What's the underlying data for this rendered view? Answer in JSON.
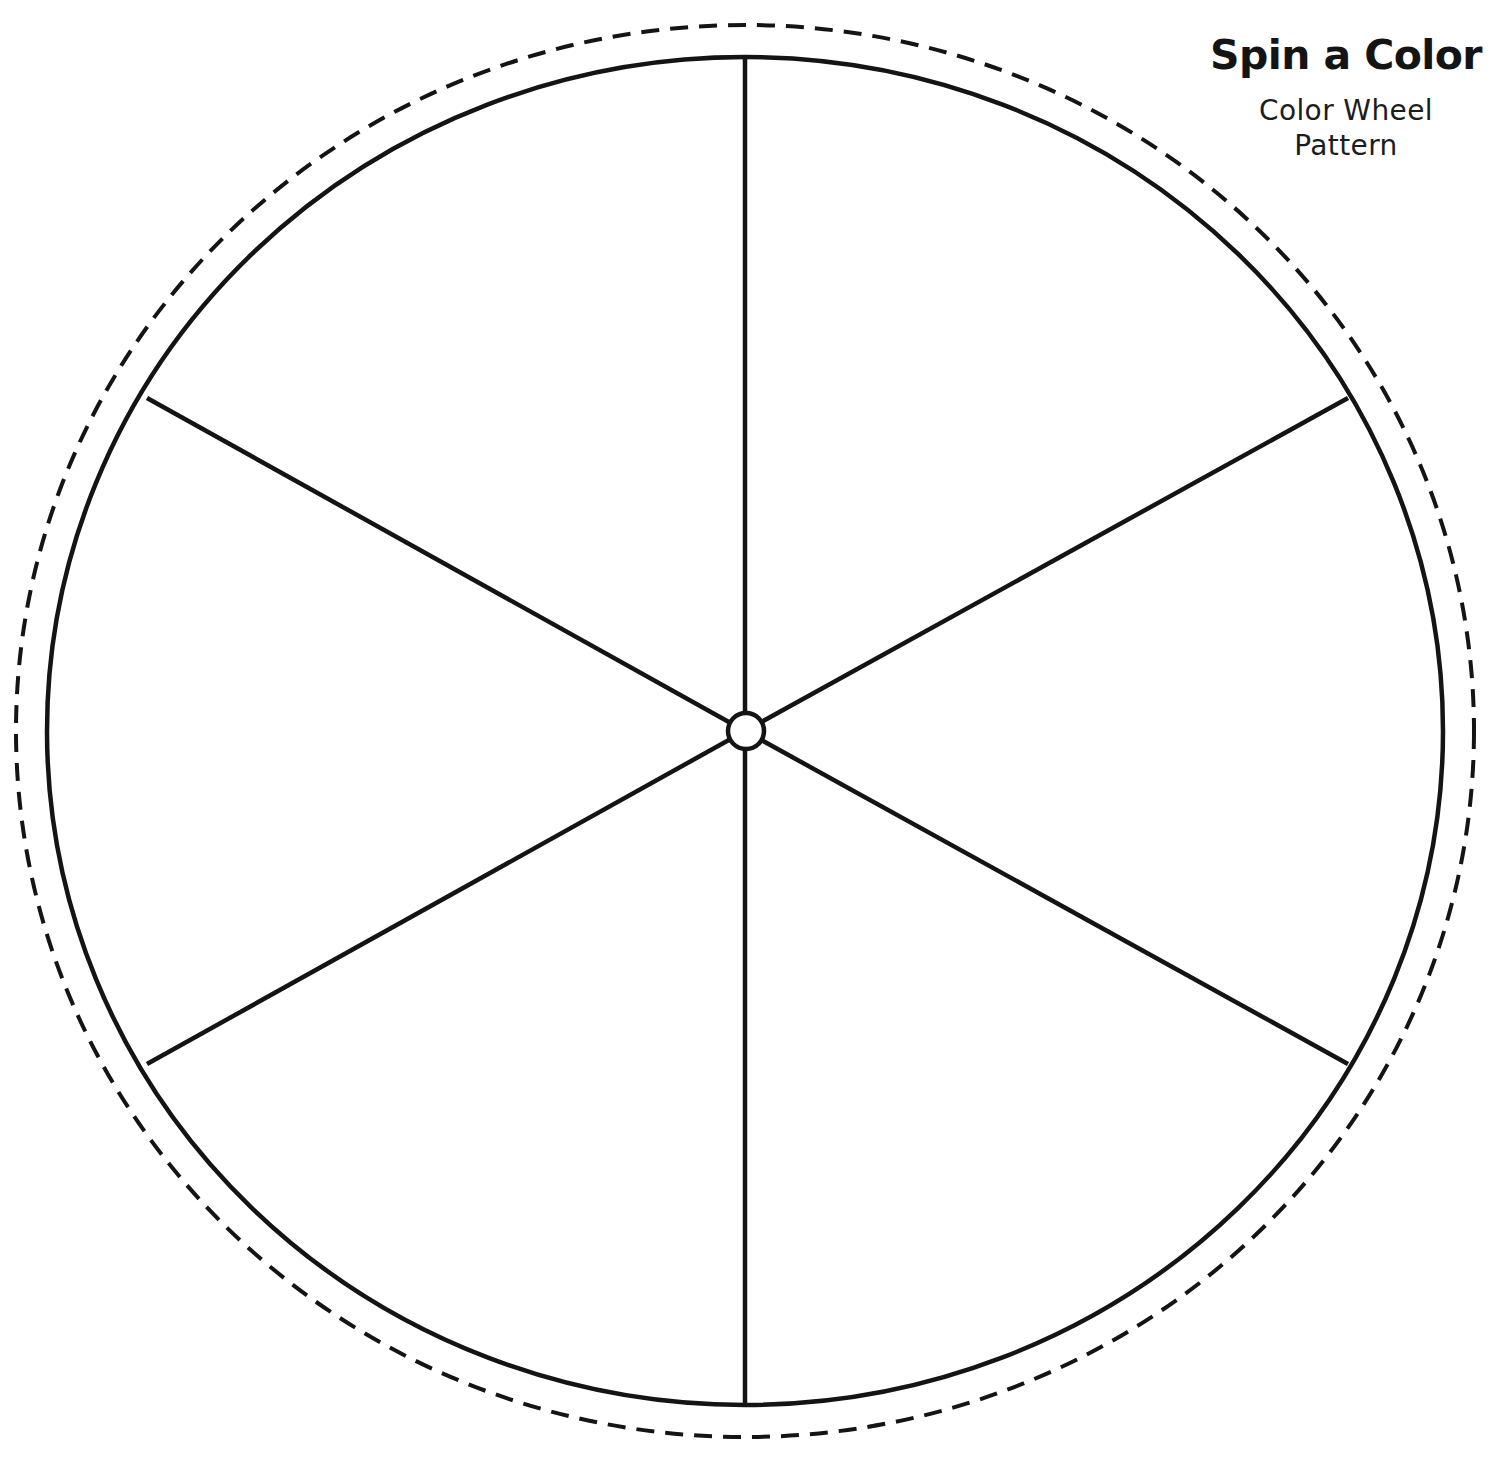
{
  "page": {
    "background_color": "#ffffff",
    "width": 1508,
    "height": 1471,
    "ink_color": "#141414"
  },
  "header": {
    "title": "Spin a Color",
    "subtitle_lines": [
      "Color Wheel",
      "Pattern"
    ]
  },
  "wheel": {
    "name": "color-wheel-template",
    "segment_count": 6,
    "center": {
      "x": 745,
      "y": 731
    },
    "solid_rim": {
      "rx": 698,
      "ry": 674,
      "stroke_color": "#141414",
      "stroke_width": 4.5,
      "style": "solid"
    },
    "cut_line": {
      "rx": 729,
      "ry": 706,
      "stroke_color": "#141414",
      "stroke_width": 4,
      "style": "dashed",
      "dash": "18 11"
    },
    "hub": {
      "radius": 18,
      "fill": "#ffffff",
      "stroke_color": "#141414",
      "stroke_width": 4.5
    },
    "spokes": [
      {
        "label": "spoke-up",
        "angle_deg": 270,
        "end_x": 745,
        "end_y": 57
      },
      {
        "label": "spoke-upper-right",
        "angle_deg": 330,
        "end_x": 1348,
        "end_y": 398
      },
      {
        "label": "spoke-lower-right",
        "angle_deg": 30,
        "end_x": 1348,
        "end_y": 1064
      },
      {
        "label": "spoke-down",
        "angle_deg": 90,
        "end_x": 745,
        "end_y": 1405
      },
      {
        "label": "spoke-lower-left",
        "angle_deg": 150,
        "end_x": 147,
        "end_y": 1064
      },
      {
        "label": "spoke-upper-left",
        "angle_deg": 210,
        "end_x": 147,
        "end_y": 398
      }
    ],
    "segments": [
      {
        "index": 1,
        "name": "segment-top-right",
        "fill": "#ffffff"
      },
      {
        "index": 2,
        "name": "segment-right",
        "fill": "#ffffff"
      },
      {
        "index": 3,
        "name": "segment-bottom-right",
        "fill": "#ffffff"
      },
      {
        "index": 4,
        "name": "segment-bottom-left",
        "fill": "#ffffff"
      },
      {
        "index": 5,
        "name": "segment-left",
        "fill": "#ffffff"
      },
      {
        "index": 6,
        "name": "segment-top-left",
        "fill": "#ffffff"
      }
    ]
  }
}
